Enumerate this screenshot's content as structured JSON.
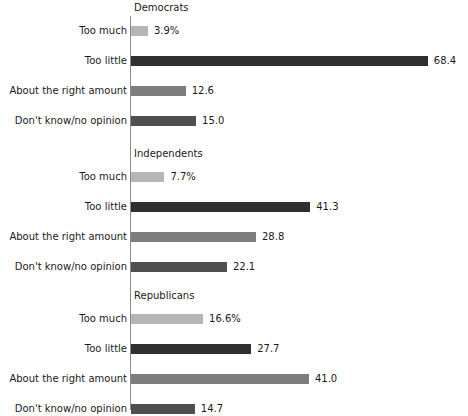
{
  "chart_data": {
    "type": "bar",
    "orientation": "horizontal",
    "title": "",
    "xlabel": "",
    "ylabel": "",
    "grid": false,
    "legend": false,
    "axis_range": [
      0,
      70
    ],
    "value_suffix_first_row": "%",
    "categories": [
      "Too much",
      "Too little",
      "About the right amount",
      "Don't know/no opinion"
    ],
    "category_colors": [
      "#b5b5b5",
      "#2f2f2f",
      "#7d7d7d",
      "#4f4f4f"
    ],
    "panels": [
      {
        "name": "Democrats",
        "values": [
          3.9,
          68.4,
          12.6,
          15.0
        ],
        "labels": [
          "3.9%",
          "68.4",
          "12.6",
          "15.0"
        ]
      },
      {
        "name": "Independents",
        "values": [
          7.7,
          41.3,
          28.8,
          22.1
        ],
        "labels": [
          "7.7%",
          "41.3",
          "28.8",
          "22.1"
        ]
      },
      {
        "name": "Republicans",
        "values": [
          16.6,
          27.7,
          41.0,
          14.7
        ],
        "labels": [
          "16.6%",
          "27.7",
          "41.0",
          "14.7"
        ]
      }
    ]
  }
}
